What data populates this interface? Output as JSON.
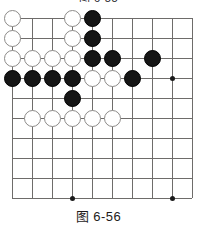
{
  "figure": {
    "caption_top_clipped": "图 6-55",
    "caption_bottom": "图 6-56",
    "type": "go-board-diagram"
  },
  "board": {
    "columns": 10,
    "rows": 10,
    "cell_size": 20,
    "origin_x": 12,
    "origin_y": 10,
    "line_color": "#6e6c6a",
    "black_color": "#151515",
    "white_color": "#ffffff",
    "white_edge_color": "#8d8b89",
    "star_points": [
      {
        "col": 9,
        "row": 4
      },
      {
        "col": 4,
        "row": 10
      },
      {
        "col": 9,
        "row": 10
      }
    ],
    "stones": [
      {
        "col": 1,
        "row": 1,
        "color": "white"
      },
      {
        "col": 4,
        "row": 1,
        "color": "white"
      },
      {
        "col": 5,
        "row": 1,
        "color": "black"
      },
      {
        "col": 1,
        "row": 2,
        "color": "white"
      },
      {
        "col": 4,
        "row": 2,
        "color": "white"
      },
      {
        "col": 5,
        "row": 2,
        "color": "black"
      },
      {
        "col": 1,
        "row": 3,
        "color": "white"
      },
      {
        "col": 2,
        "row": 3,
        "color": "white"
      },
      {
        "col": 3,
        "row": 3,
        "color": "white"
      },
      {
        "col": 4,
        "row": 3,
        "color": "white"
      },
      {
        "col": 5,
        "row": 3,
        "color": "black"
      },
      {
        "col": 6,
        "row": 3,
        "color": "black"
      },
      {
        "col": 8,
        "row": 3,
        "color": "black"
      },
      {
        "col": 1,
        "row": 4,
        "color": "black"
      },
      {
        "col": 2,
        "row": 4,
        "color": "black"
      },
      {
        "col": 3,
        "row": 4,
        "color": "black"
      },
      {
        "col": 4,
        "row": 4,
        "color": "black"
      },
      {
        "col": 5,
        "row": 4,
        "color": "white"
      },
      {
        "col": 6,
        "row": 4,
        "color": "white"
      },
      {
        "col": 7,
        "row": 4,
        "color": "black"
      },
      {
        "col": 4,
        "row": 5,
        "color": "black"
      },
      {
        "col": 2,
        "row": 6,
        "color": "white"
      },
      {
        "col": 3,
        "row": 6,
        "color": "white"
      },
      {
        "col": 4,
        "row": 6,
        "color": "white"
      },
      {
        "col": 5,
        "row": 6,
        "color": "white"
      },
      {
        "col": 6,
        "row": 6,
        "color": "white"
      }
    ]
  }
}
